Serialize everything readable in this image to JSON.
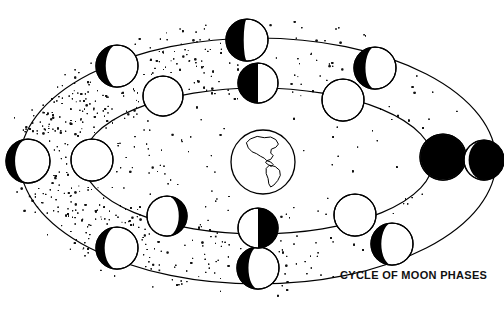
{
  "figure": {
    "title": "CYCLE OF MOON PHASES",
    "kind": "astronomy-diagram",
    "background_color": "#ffffff",
    "ink_color": "#000000"
  },
  "earth": {
    "label": "earth-globe",
    "center_x": 263,
    "center_y": 162,
    "radius": 32,
    "continents": "Americas"
  },
  "orbits": [
    {
      "name": "outer-orbit",
      "cx": 258,
      "cy": 161,
      "rx": 238,
      "ry": 123
    },
    {
      "name": "inner-orbit",
      "cx": 258,
      "cy": 161,
      "rx": 175,
      "ry": 73
    }
  ],
  "stipple": {
    "name": "starfield-stipple",
    "dot_color": "#111111",
    "density_left": "dense",
    "density_right": "sparse"
  },
  "moons": [
    {
      "id": "outer-1",
      "phase": "waxing-crescent",
      "lit_side": "right",
      "lit_fraction": 0.3,
      "cx": 28,
      "cy": 161,
      "r": 22,
      "orbit": "outer-orbit"
    },
    {
      "id": "outer-2",
      "phase": "waxing-crescent",
      "lit_side": "right",
      "lit_fraction": 0.32,
      "cx": 117,
      "cy": 66,
      "r": 21,
      "orbit": "outer-orbit"
    },
    {
      "id": "outer-3",
      "phase": "first-quarter",
      "lit_side": "right",
      "lit_fraction": 0.45,
      "cx": 247,
      "cy": 40,
      "r": 21,
      "orbit": "outer-orbit"
    },
    {
      "id": "outer-4",
      "phase": "waxing-gibbous",
      "lit_side": "right",
      "lit_fraction": 0.35,
      "cx": 375,
      "cy": 68,
      "r": 21,
      "orbit": "outer-orbit"
    },
    {
      "id": "outer-5",
      "phase": "new-moon",
      "lit_side": "right",
      "lit_fraction": 0.02,
      "cx": 443,
      "cy": 157,
      "r": 23,
      "orbit": "outer-orbit"
    },
    {
      "id": "outer-6",
      "phase": "waning-crescent",
      "lit_side": "right",
      "lit_fraction": 0.33,
      "cx": 392,
      "cy": 244,
      "r": 21,
      "orbit": "outer-orbit"
    },
    {
      "id": "outer-7",
      "phase": "waning-crescent",
      "lit_side": "right",
      "lit_fraction": 0.35,
      "cx": 258,
      "cy": 268,
      "r": 21,
      "orbit": "outer-orbit"
    },
    {
      "id": "outer-8",
      "phase": "waning-crescent",
      "lit_side": "right",
      "lit_fraction": 0.3,
      "cx": 117,
      "cy": 248,
      "r": 21,
      "orbit": "outer-orbit"
    },
    {
      "id": "inner-1",
      "phase": "full-moon",
      "lit_side": "full",
      "lit_fraction": 1.0,
      "cx": 92,
      "cy": 160,
      "r": 21,
      "orbit": "inner-orbit"
    },
    {
      "id": "inner-2",
      "phase": "full-moon",
      "lit_side": "full",
      "lit_fraction": 0.95,
      "cx": 163,
      "cy": 96,
      "r": 20,
      "orbit": "inner-orbit"
    },
    {
      "id": "inner-3",
      "phase": "last-quarter",
      "lit_side": "right",
      "lit_fraction": 0.5,
      "cx": 258,
      "cy": 83,
      "r": 20,
      "orbit": "inner-orbit"
    },
    {
      "id": "inner-4",
      "phase": "new-moon",
      "lit_side": "right",
      "lit_fraction": 0.05,
      "cx": 343,
      "cy": 100,
      "r": 21,
      "orbit": "inner-orbit"
    },
    {
      "id": "inner-5",
      "phase": "new-moon",
      "lit_side": "left",
      "lit_fraction": 0.22,
      "cx": 484,
      "cy": 160,
      "r": 20,
      "orbit": "inner-orbit"
    },
    {
      "id": "inner-6",
      "phase": "new-moon",
      "lit_side": "right",
      "lit_fraction": 0.05,
      "cx": 355,
      "cy": 215,
      "r": 21,
      "orbit": "inner-orbit"
    },
    {
      "id": "inner-7",
      "phase": "first-quarter",
      "lit_side": "left",
      "lit_fraction": 0.5,
      "cx": 258,
      "cy": 228,
      "r": 20,
      "orbit": "inner-orbit"
    },
    {
      "id": "inner-8",
      "phase": "waxing-gibbous",
      "lit_side": "left",
      "lit_fraction": 0.7,
      "cx": 167,
      "cy": 216,
      "r": 20,
      "orbit": "inner-orbit"
    }
  ]
}
